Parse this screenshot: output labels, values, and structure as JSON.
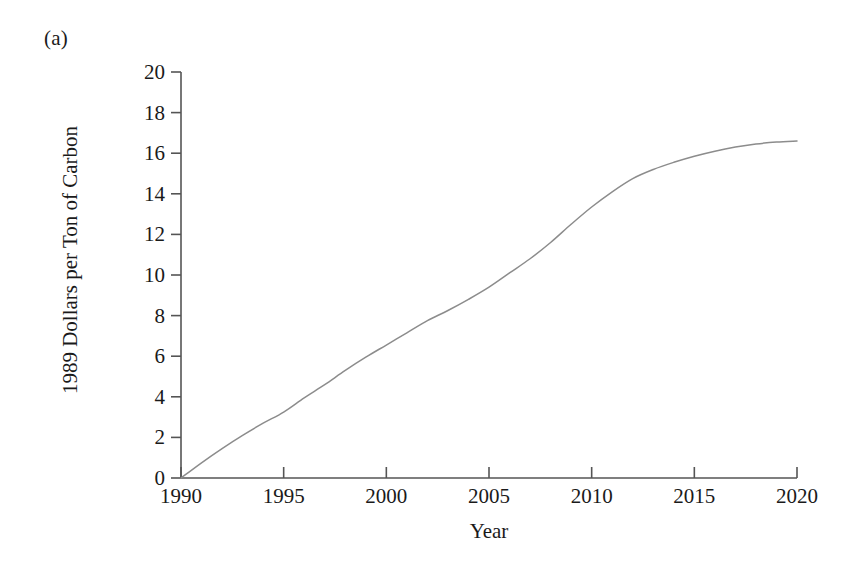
{
  "figure": {
    "panel_label": "(a)",
    "background_color": "#ffffff",
    "line_color": "#8c8c8c",
    "axis_color": "#555555",
    "text_color": "#1a1a1a"
  },
  "chart_data": {
    "type": "line",
    "title": "",
    "subtitle": "",
    "panel": "(a)",
    "xlabel": "Year",
    "ylabel": "1989 Dollars per Ton of Carbon",
    "xlim": [
      1990,
      2020
    ],
    "ylim": [
      0,
      20
    ],
    "xticks": [
      1990,
      1995,
      2000,
      2005,
      2010,
      2015,
      2020
    ],
    "xticklabels": [
      "1990",
      "1995",
      "2000",
      "2005",
      "2010",
      "2015",
      "2020"
    ],
    "yticks": [
      0,
      2,
      4,
      6,
      8,
      10,
      12,
      14,
      16,
      18,
      20
    ],
    "yticklabels": [
      "0",
      "2",
      "4",
      "6",
      "8",
      "10",
      "12",
      "14",
      "16",
      "18",
      "20"
    ],
    "grid": false,
    "legend": null,
    "legend_position": "none",
    "annotations": [],
    "series": [
      {
        "name": "Carbon tax path",
        "x": [
          1990,
          1991,
          1992,
          1993,
          1994,
          1995,
          1996,
          1997,
          1998,
          1999,
          2000,
          2001,
          2002,
          2003,
          2004,
          2005,
          2006,
          2007,
          2008,
          2009,
          2010,
          2011,
          2012,
          2013,
          2014,
          2015,
          2016,
          2017,
          2018,
          2019,
          2020
        ],
        "y": [
          0.0,
          0.75,
          1.45,
          2.1,
          2.7,
          3.25,
          3.95,
          4.6,
          5.3,
          5.95,
          6.55,
          7.15,
          7.75,
          8.25,
          8.8,
          9.4,
          10.1,
          10.8,
          11.6,
          12.5,
          13.35,
          14.1,
          14.75,
          15.2,
          15.55,
          15.85,
          16.1,
          16.3,
          16.45,
          16.55,
          16.6
        ]
      }
    ]
  }
}
